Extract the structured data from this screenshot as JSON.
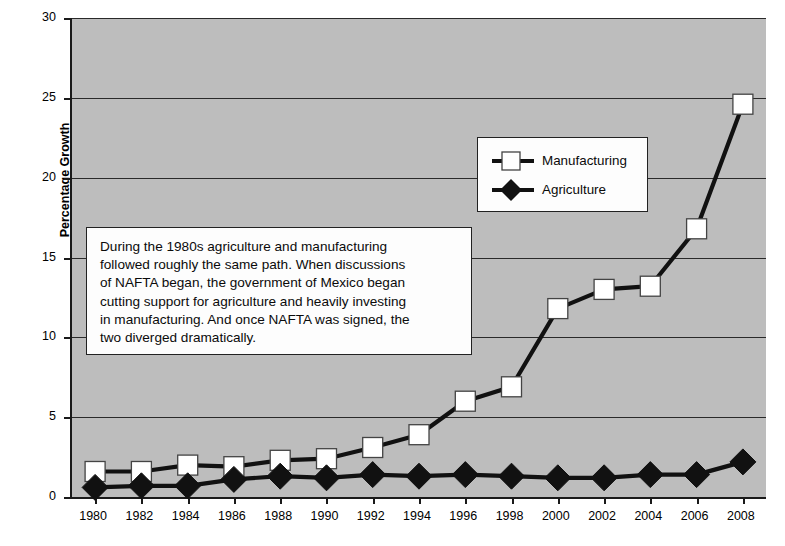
{
  "chart_data": {
    "type": "line",
    "title": "",
    "xlabel": "",
    "ylabel": "Percentage Growth",
    "xlim": [
      1979,
      2009
    ],
    "ylim": [
      0,
      30
    ],
    "ytick_labels": [
      "30",
      "25",
      "20",
      "15",
      "10",
      "5",
      "0"
    ],
    "ytick_values": [
      30,
      25,
      20,
      15,
      10,
      5,
      0
    ],
    "grid": true,
    "legend_position": "upper-center-right",
    "x": [
      1980,
      1982,
      1984,
      1986,
      1988,
      1990,
      1992,
      1994,
      1996,
      1998,
      2000,
      2002,
      2004,
      2006,
      2008
    ],
    "categories": [
      "1980",
      "1982",
      "1984",
      "1986",
      "1988",
      "1990",
      "1992",
      "1994",
      "1996",
      "1998",
      "2000",
      "2002",
      "2004",
      "2006",
      "2008"
    ],
    "series": [
      {
        "name": "Manufacturing",
        "marker": "white-square",
        "values": [
          1.6,
          1.6,
          2.0,
          1.9,
          2.3,
          2.4,
          3.1,
          3.9,
          6.0,
          6.9,
          11.8,
          13.0,
          13.2,
          16.8,
          24.6
        ]
      },
      {
        "name": "Agriculture",
        "marker": "black-diamond",
        "values": [
          0.6,
          0.7,
          0.7,
          1.1,
          1.3,
          1.2,
          1.4,
          1.3,
          1.4,
          1.3,
          1.2,
          1.2,
          1.4,
          1.4,
          2.2
        ]
      }
    ],
    "annotation": "During the 1980s agriculture and manufacturing followed roughly the same path. When discussions of NAFTA began, the government of Mexico began cutting support for agriculture and heavily investing in manufacturing. And once NAFTA was signed, the two diverged dramatically.",
    "annotation_lines": [
      "During the 1980s agriculture and manufacturing",
      "followed roughly the same path. When discussions",
      "of NAFTA began, the government of Mexico began",
      "cutting support for agriculture and heavily investing",
      "in manufacturing. And once NAFTA was signed, the",
      "two diverged dramatically."
    ],
    "colors": {
      "plot_background": "#bdbdbd",
      "page_background": "#ffffff",
      "line": "#111111",
      "gridline": "#2a2a2a",
      "axis": "#1a1a1a",
      "manufacturing_marker_fill": "#ffffff",
      "agriculture_marker_fill": "#111111",
      "box_background": "#fdfdfd",
      "box_border": "#222222"
    }
  },
  "legend": {
    "items": [
      {
        "label": "Manufacturing",
        "marker": "white-square"
      },
      {
        "label": "Agriculture",
        "marker": "black-diamond"
      }
    ]
  }
}
